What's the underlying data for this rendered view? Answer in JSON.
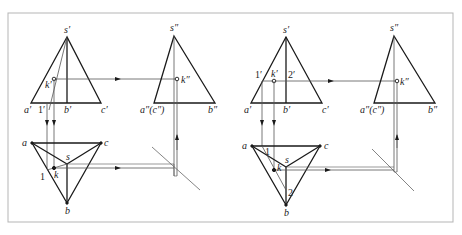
{
  "figure": {
    "frame_color": "#b5b5b5",
    "line_color": "#1a1a1a",
    "thin_line_color": "#555555",
    "left_diagram": {
      "front_view": {
        "apex": "s′",
        "base_left": "a′",
        "base_mid": "b′",
        "base_right": "c′",
        "point": "k′",
        "aux_point": "1′"
      },
      "side_view": {
        "apex": "s″",
        "base_left": "a″(c″)",
        "base_right": "b″",
        "point": "k″"
      },
      "top_view": {
        "a": "a",
        "b": "b",
        "c": "c",
        "s": "s",
        "k": "k",
        "aux_point": "1"
      }
    },
    "right_diagram": {
      "front_view": {
        "apex": "s′",
        "base_left": "a′",
        "base_mid": "b′",
        "base_right": "c′",
        "point": "k′",
        "aux_point_1": "1′",
        "aux_point_2": "2′"
      },
      "side_view": {
        "apex": "s″",
        "base_left": "a″(c″)",
        "base_right": "b″",
        "point": "k″"
      },
      "top_view": {
        "a": "a",
        "b": "b",
        "c": "c",
        "s": "s",
        "k": "k",
        "aux_point_1": "1",
        "aux_point_2": "2"
      }
    }
  }
}
